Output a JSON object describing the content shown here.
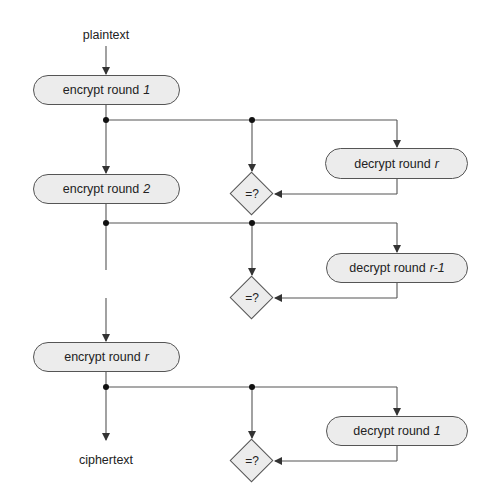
{
  "diagram": {
    "input_label": "plaintext",
    "output_label": "ciphertext",
    "encrypt_boxes": [
      {
        "prefix": "encrypt round",
        "round": "1"
      },
      {
        "prefix": "encrypt round",
        "round": "2"
      },
      {
        "prefix": "encrypt round",
        "round": "r"
      }
    ],
    "decrypt_boxes": [
      {
        "prefix": "decrypt round",
        "round": "r"
      },
      {
        "prefix": "decrypt round",
        "round": "r-1"
      },
      {
        "prefix": "decrypt round",
        "round": "1"
      }
    ],
    "comparators": [
      {
        "label": "=?"
      },
      {
        "label": "=?"
      },
      {
        "label": "=?"
      }
    ],
    "colors": {
      "line": "#555555",
      "node_fill": "#ececec",
      "background": "#ffffff"
    }
  }
}
